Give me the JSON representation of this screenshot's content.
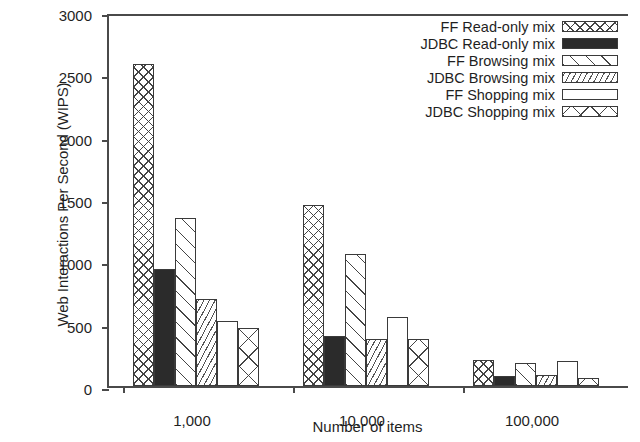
{
  "chart_data": {
    "type": "bar",
    "title": "",
    "xlabel": "Number of items",
    "ylabel": "Web Interactions Per Second (WIPS)",
    "categories": [
      "1,000",
      "10,000",
      "100,000"
    ],
    "ylim": [
      0,
      3000
    ],
    "yticks": [
      0,
      500,
      1000,
      1500,
      2000,
      2500,
      3000
    ],
    "ytick_labels": [
      "0",
      "500",
      "1000",
      "1500",
      "2000",
      "2500",
      "3000"
    ],
    "grid": false,
    "legend_position": "top-right",
    "series": [
      {
        "name": "FF Read-only mix",
        "pattern": "crosshatch",
        "values": [
          2580,
          1450,
          210
        ]
      },
      {
        "name": "JDBC Read-only mix",
        "pattern": "solid",
        "values": [
          935,
          400,
          80
        ]
      },
      {
        "name": "FF Browsing mix",
        "pattern": "diag",
        "values": [
          1350,
          1055,
          185
        ]
      },
      {
        "name": "JDBC Browsing mix",
        "pattern": "dense",
        "values": [
          700,
          380,
          90
        ]
      },
      {
        "name": "FF Shopping mix",
        "pattern": "empty",
        "values": [
          520,
          555,
          200
        ]
      },
      {
        "name": "JDBC Shopping mix",
        "pattern": "bigx",
        "values": [
          465,
          380,
          65
        ]
      }
    ]
  }
}
